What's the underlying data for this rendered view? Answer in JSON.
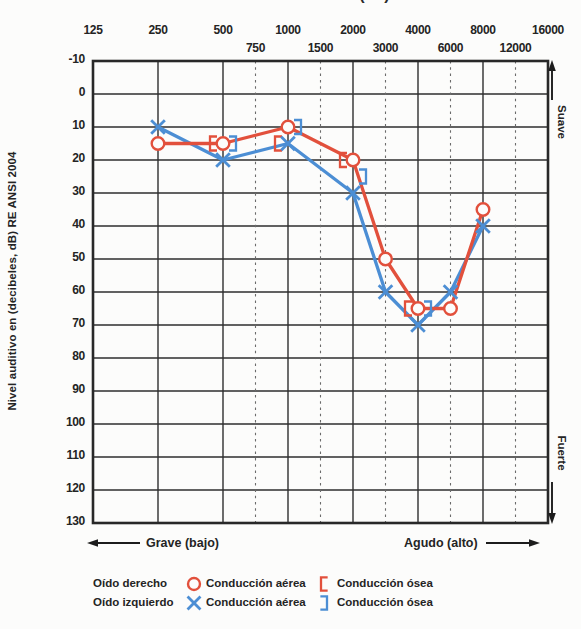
{
  "clipped_top_title": "Frecuencia (Hz)",
  "y_axis": {
    "title": "Nivel auditivo en (decibeles, dB) RE ANSI 2004",
    "ticks": [
      "-10",
      "0",
      "10",
      "20",
      "30",
      "40",
      "50",
      "60",
      "70",
      "80",
      "90",
      "100",
      "110",
      "120",
      "130"
    ]
  },
  "x_axis": {
    "main_ticks": [
      "125",
      "250",
      "500",
      "1000",
      "2000",
      "4000",
      "8000",
      "16000"
    ],
    "mid_ticks": [
      "750",
      "1500",
      "3000",
      "6000",
      "12000"
    ]
  },
  "right_axis": {
    "top_label": "Suave",
    "bottom_label": "Fuerte"
  },
  "bottom_axis": {
    "left_label": "Grave (bajo)",
    "right_label": "Agudo (alto)"
  },
  "legend": {
    "rows": [
      {
        "ear": "Oído derecho",
        "air_label": "Conducción aérea",
        "bone_label": "Conducción ósea",
        "marker_air": "circle",
        "marker_bone": "bracket-left",
        "color": "#e2503c"
      },
      {
        "ear": "Oído izquierdo",
        "air_label": "Conducción aérea",
        "bone_label": "Conducción ósea",
        "marker_air": "x",
        "marker_bone": "bracket-right",
        "color": "#4c8ed4"
      }
    ]
  },
  "colors": {
    "right_ear": "#e2503c",
    "left_ear": "#4c8ed4",
    "grid": "#2e2e2e",
    "dashed_grid": "#6b6b6b",
    "ink": "#1c1c1c"
  },
  "chart_data": {
    "type": "line",
    "x_unit": "Hz",
    "y_unit": "dB HL RE ANSI 2004",
    "x_scale": "octave",
    "x_ticks": [
      125,
      250,
      500,
      750,
      1000,
      1500,
      2000,
      3000,
      4000,
      6000,
      8000,
      12000,
      16000
    ],
    "mid_octave_ticks": [
      750,
      1500,
      3000,
      6000,
      12000
    ],
    "ylim": [
      -10,
      130
    ],
    "y_step": 10,
    "y_inverted": true,
    "grid": true,
    "legend_position": "bottom",
    "series": [
      {
        "key": "right-ear-air",
        "name": "Oído derecho – Conducción aérea",
        "marker": "circle",
        "color": "#e2503c",
        "connect": true,
        "points": [
          {
            "f": 250,
            "db": 15
          },
          {
            "f": 500,
            "db": 15
          },
          {
            "f": 1000,
            "db": 10
          },
          {
            "f": 2000,
            "db": 20
          },
          {
            "f": 3000,
            "db": 50
          },
          {
            "f": 4000,
            "db": 65
          },
          {
            "f": 6000,
            "db": 65
          },
          {
            "f": 8000,
            "db": 35
          }
        ]
      },
      {
        "key": "left-ear-air",
        "name": "Oído izquierdo – Conducción aérea",
        "marker": "x",
        "color": "#4c8ed4",
        "connect": true,
        "points": [
          {
            "f": 250,
            "db": 10
          },
          {
            "f": 500,
            "db": 20
          },
          {
            "f": 1000,
            "db": 15
          },
          {
            "f": 2000,
            "db": 30
          },
          {
            "f": 3000,
            "db": 60
          },
          {
            "f": 4000,
            "db": 70
          },
          {
            "f": 6000,
            "db": 60
          },
          {
            "f": 8000,
            "db": 40
          }
        ]
      },
      {
        "key": "right-ear-bone",
        "name": "Oído derecho – Conducción ósea",
        "marker": "bracket-left",
        "color": "#e2503c",
        "connect": false,
        "points": [
          {
            "f": 500,
            "db": 15
          },
          {
            "f": 1000,
            "db": 15
          },
          {
            "f": 2000,
            "db": 20
          },
          {
            "f": 4000,
            "db": 65
          }
        ]
      },
      {
        "key": "left-ear-bone",
        "name": "Oído izquierdo – Conducción ósea",
        "marker": "bracket-right",
        "color": "#4c8ed4",
        "connect": false,
        "points": [
          {
            "f": 500,
            "db": 15
          },
          {
            "f": 1000,
            "db": 10
          },
          {
            "f": 2000,
            "db": 25
          },
          {
            "f": 4000,
            "db": 65
          }
        ]
      }
    ]
  }
}
